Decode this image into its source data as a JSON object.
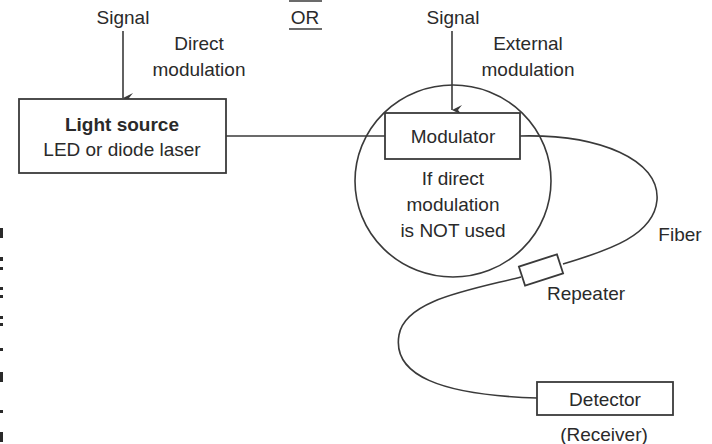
{
  "diagram": {
    "title_separator": "OR",
    "direct_branch": {
      "signal_label": "Signal",
      "mode_label_line1": "Direct",
      "mode_label_line2": "modulation"
    },
    "external_branch": {
      "signal_label": "Signal",
      "mode_label_line1": "External",
      "mode_label_line2": "modulation"
    },
    "light_source": {
      "title": "Light source",
      "subtitle": "LED or diode laser"
    },
    "modulator": {
      "label": "Modulator",
      "note_line1": "If direct",
      "note_line2": "modulation",
      "note_line3": "is NOT used"
    },
    "fiber_label": "Fiber",
    "repeater_label": "Repeater",
    "detector": {
      "label": "Detector",
      "sublabel": "(Receiver)"
    },
    "colors": {
      "line": "#3a3a3a",
      "text": "#2a2a2a",
      "background": "#ffffff"
    }
  }
}
